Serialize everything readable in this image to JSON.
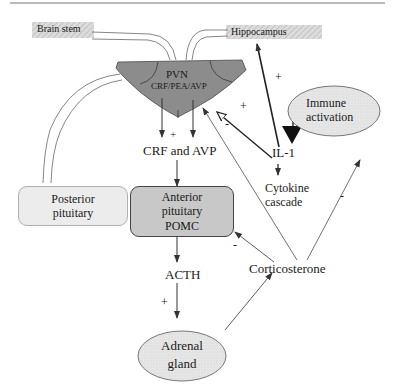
{
  "nodes": {
    "brain_stem": "Brain stem",
    "hippocampus": "Hippocampus",
    "pvn_title": "PVN",
    "pvn_sub": "CRF/PEA/AVP",
    "immune_line1": "Immune",
    "immune_line2": "activation",
    "crf_avp": "CRF and AVP",
    "il1": "IL-1",
    "cytokine_line1": "Cytokine",
    "cytokine_line2": "cascade",
    "posterior_line1": "Posterior",
    "posterior_line2": "pituitary",
    "anterior_line1": "Anterior",
    "anterior_line2": "pituitary",
    "anterior_line3": "POMC",
    "acth": "ACTH",
    "corticosterone": "Corticosterone",
    "adrenal_line1": "Adrenal",
    "adrenal_line2": "gland"
  },
  "signs": {
    "il1_to_hippocampus": "+",
    "il1_to_pvn": "+",
    "cort_to_pvn": "-",
    "pvn_to_crf": "+",
    "cort_to_anterior": "-",
    "acth_to_adrenal": "+",
    "cort_to_immune": "-"
  },
  "colors": {
    "pvn_fill": "#8a8a8a",
    "anterior_fill": "#c8c8c8",
    "posterior_fill": "#ececec",
    "ellipse_fill": "#e2e2e2",
    "hatch_fill": "#d6d6d6",
    "line": "#333333"
  }
}
